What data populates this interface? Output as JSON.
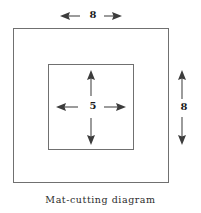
{
  "figure": {
    "caption": "Mat-cutting diagram",
    "type": "geometric-diagram",
    "colors": {
      "background": "#ffffff",
      "square_stroke": "#707070",
      "arrow_stroke": "#4a4a4a",
      "arrow_head": "#3c3c3c",
      "text": "#1a1a1a"
    },
    "shapes": [
      {
        "name": "outer-square",
        "label": "outer mat border",
        "side_value": "8",
        "units": ""
      },
      {
        "name": "inner-square",
        "label": "inner cut-out opening",
        "side_value": "5",
        "units": ""
      }
    ],
    "dimensions": {
      "top": {
        "value": "8",
        "orientation": "horizontal",
        "target": "outer-square-width"
      },
      "right": {
        "value": "8",
        "orientation": "vertical",
        "target": "outer-square-height"
      },
      "center": {
        "value": "5",
        "orientation": "both",
        "target": "inner-square-side"
      }
    }
  }
}
